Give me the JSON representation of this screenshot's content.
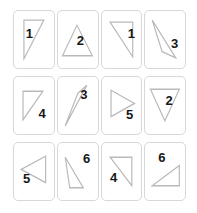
{
  "canvas": {
    "width": 197,
    "height": 213,
    "background": "#ffffff",
    "title": "Triangle orientation card grid"
  },
  "style": {
    "card_border_color": "#d8d8d8",
    "card_fill": "#ffffff",
    "triangle_stroke": "#b9b9b9",
    "number_color": "#171717"
  },
  "grid": {
    "rows": 3,
    "columns": 4,
    "count": 12
  },
  "cards": [
    {
      "id": "card-1",
      "label": "1",
      "shape": "right-triangle-hypotenuse-down-left",
      "points": "11,9 33,9 11,47",
      "num_x": 34,
      "num_y": 43
    },
    {
      "id": "card-2",
      "label": "2",
      "shape": "triangle-pointing-up",
      "points": "21,14 38,44 5,44",
      "num_x": 50,
      "num_y": 57
    },
    {
      "id": "card-3",
      "label": "1",
      "shape": "right-triangle-hypotenuse-down-right",
      "points": "9,11 34,11 34,45",
      "num_x": 66,
      "num_y": 44
    },
    {
      "id": "card-4",
      "label": "3",
      "shape": "narrow-triangle-pointing-down-right",
      "points": "8,9 34,46 19,40",
      "num_x": 65,
      "num_y": 62
    },
    {
      "id": "card-5",
      "label": "4",
      "shape": "right-triangle-hypotenuse-down-left",
      "points": "10,14 32,14 10,42",
      "num_x": 62,
      "num_y": 70
    },
    {
      "id": "card-6",
      "label": "3",
      "shape": "narrow-triangle-pointing-down-left",
      "points": "32,8 22,16 8,48",
      "num_x": 58,
      "num_y": 33
    },
    {
      "id": "card-7",
      "label": "5",
      "shape": "triangle-pointing-right",
      "points": "10,13 36,26 10,39",
      "num_x": 62,
      "num_y": 72
    },
    {
      "id": "card-8",
      "label": "2",
      "shape": "triangle-pointing-down",
      "points": "6,12 38,12 22,43",
      "num_x": 53,
      "num_y": 45
    },
    {
      "id": "card-9",
      "label": "5",
      "shape": "triangle-pointing-left",
      "points": "8,26 35,13 35,39",
      "num_x": 28,
      "num_y": 68
    },
    {
      "id": "card-10",
      "label": "6",
      "shape": "triangle-apex-top-left",
      "points": "8,14 28,44 13,44",
      "num_x": 64,
      "num_y": 30
    },
    {
      "id": "card-11",
      "label": "4",
      "shape": "right-triangle-hypotenuse-down-right",
      "points": "9,14 33,14 33,42",
      "num_x": 27,
      "num_y": 67
    },
    {
      "id": "card-12",
      "label": "6",
      "shape": "flat-triangle-rising-right",
      "points": "8,42 38,42 38,22",
      "num_x": 37,
      "num_y": 27
    }
  ]
}
